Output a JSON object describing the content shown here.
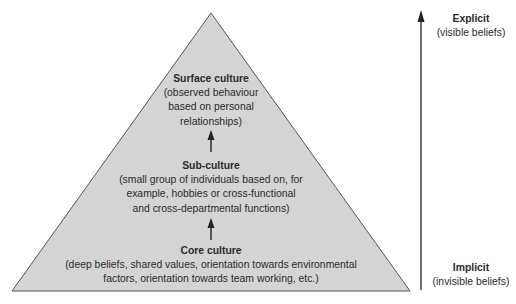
{
  "diagram": {
    "type": "pyramid",
    "colors": {
      "fill": "#d4d4d4",
      "stroke": "#555555",
      "arrow": "#222222",
      "text": "#2a2a2a"
    },
    "levels": [
      {
        "title": "Surface culture",
        "description_lines": [
          "(observed behaviour",
          "based on personal",
          "relationships)"
        ]
      },
      {
        "title": "Sub-culture",
        "description_lines": [
          "(small group of individuals based on, for",
          "example, hobbies or cross-functional",
          "and cross-departmental functions)"
        ]
      },
      {
        "title": "Core culture",
        "description_lines": [
          "(deep beliefs, shared values, orientation towards environmental",
          "factors, orientation towards team working, etc.)"
        ]
      }
    ],
    "axis": {
      "top": {
        "title": "Explicit",
        "subtitle": "(visible beliefs)"
      },
      "bottom": {
        "title": "Implicit",
        "subtitle": "(invisible beliefs)"
      }
    }
  }
}
